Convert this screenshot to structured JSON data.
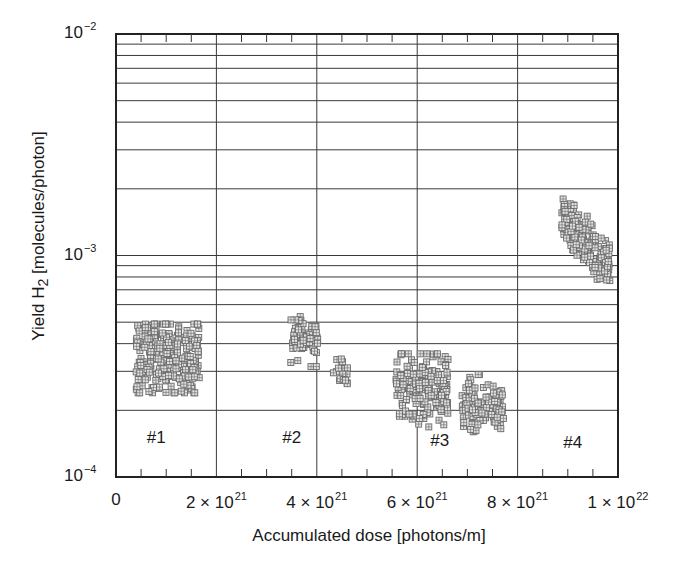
{
  "chart_data": {
    "type": "scatter",
    "title": "",
    "xlabel": "Accumulated dose [photons/m]",
    "ylabel": "Yield H2 [molecules/photon]",
    "ylabel_parts": {
      "prefix": "Yield H",
      "sub": "2",
      "suffix": " [molecules/photon]"
    },
    "x_scale": "linear",
    "y_scale": "log",
    "xlim": [
      0,
      1e+22
    ],
    "ylim": [
      0.0001,
      0.01
    ],
    "grid": true,
    "x_ticks": [
      {
        "value": 0,
        "mant": "0",
        "exp": ""
      },
      {
        "value": 2e+21,
        "mant": "2 × 10",
        "exp": "21"
      },
      {
        "value": 4e+21,
        "mant": "4 × 10",
        "exp": "21"
      },
      {
        "value": 6e+21,
        "mant": "6 × 10",
        "exp": "21"
      },
      {
        "value": 8e+21,
        "mant": "8 × 10",
        "exp": "21"
      },
      {
        "value": 1e+22,
        "mant": "1 × 10",
        "exp": "22"
      }
    ],
    "y_ticks": [
      {
        "value": 0.01,
        "mant": "10",
        "exp": "−2"
      },
      {
        "value": 0.001,
        "mant": "10",
        "exp": "−3"
      },
      {
        "value": 0.0001,
        "mant": "10",
        "exp": "−4"
      }
    ],
    "marker": {
      "shape": "gridded-square",
      "size": 6,
      "color": "#6a6a6a"
    },
    "annotations": [
      {
        "text": "#1",
        "x": 8e+20,
        "y": 0.00015
      },
      {
        "text": "#2",
        "x": 3.5e+21,
        "y": 0.00015
      },
      {
        "text": "#3",
        "x": 6.45e+21,
        "y": 0.000145
      },
      {
        "text": "#4",
        "x": 9.1e+21,
        "y": 0.000142
      }
    ],
    "series": [
      {
        "name": "#1",
        "x_range": [
          4e+20,
          1.66e+21
        ],
        "y_range": [
          0.00024,
          0.00049
        ],
        "y_center": 0.00035,
        "y_spread": 0.09,
        "trend": 0,
        "n": 260
      },
      {
        "name": "#2a",
        "x_range": [
          3.48e+21,
          4.02e+21
        ],
        "y_range": [
          0.000315,
          0.00053
        ],
        "y_center": 0.00042,
        "y_spread": 0.05,
        "trend": 0,
        "n": 60
      },
      {
        "name": "#2b",
        "x_range": [
          4.32e+21,
          4.62e+21
        ],
        "y_range": [
          0.00026,
          0.00035
        ],
        "y_center": 0.000305,
        "y_spread": 0.04,
        "trend": 0,
        "n": 18
      },
      {
        "name": "#3a",
        "x_range": [
          5.58e+21,
          6.62e+21
        ],
        "y_range": [
          0.00015,
          0.00036
        ],
        "y_center": 0.00025,
        "y_spread": 0.08,
        "trend": 0,
        "n": 190
      },
      {
        "name": "#3b",
        "x_range": [
          6.88e+21,
          7.72e+21
        ],
        "y_range": [
          0.00016,
          0.00029
        ],
        "y_center": 0.00021,
        "y_spread": 0.06,
        "trend": 0,
        "n": 120
      },
      {
        "name": "#4",
        "x_range": [
          8.88e+21,
          9.84e+21
        ],
        "y_range": [
          0.00077,
          0.0018
        ],
        "y_center": 0.00115,
        "y_spread": 0.05,
        "trend": -0.22,
        "n": 170
      }
    ]
  }
}
